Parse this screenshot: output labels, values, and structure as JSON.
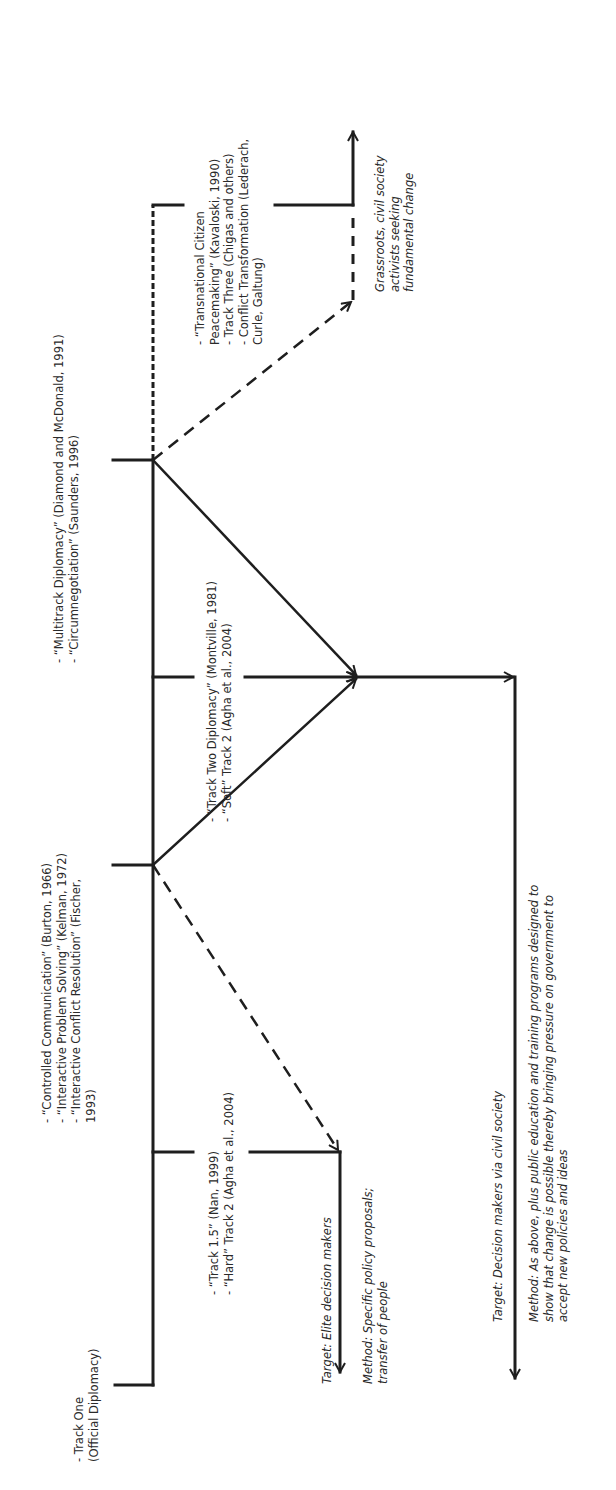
{
  "diagram": {
    "orientation": "rotated-90-ccw",
    "colors": {
      "line": "#1e1e1e",
      "text": "#2a2a2a",
      "background": "#ffffff"
    },
    "track_one": {
      "lines": [
        "- Track One",
        "(Official Diplomacy)"
      ]
    },
    "group_problem_solving": {
      "lines": [
        "- “Controlled Communication” (Burton, 1966)",
        "- “Interactive Problem Solving” (Kelman, 1972)",
        "- “Interactive Conflict Resolution” (Fischer,",
        "   1993)"
      ]
    },
    "group_multitrack": {
      "lines": [
        "- “Multitrack Diplomacy” (Diamond and McDonald, 1991)",
        "- “Circumnegotiation” (Saunders, 1996)"
      ]
    },
    "track_one_five": {
      "lines": [
        "- “Track 1.5” (Nan, 1999)",
        "- “Hard” Track 2 (Agha et al., 2004)"
      ]
    },
    "track_two": {
      "lines": [
        "- “Track Two Diplomacy” (Montville, 1981)",
        "- “Soft” Track 2 (Agha et al., 2004)"
      ]
    },
    "track_three": {
      "lines": [
        "- “Transnational Citizen",
        "   Peacemaking” (Kavaloski, 1990)",
        "- Track Three (Chigas and others)",
        "- Conflict Transformation (Lederach,",
        "   Curle, Galtung)"
      ]
    },
    "elite_outcome": {
      "target": "Target: Elite decision makers",
      "method_lines": [
        "Method: Specific policy proposals;",
        "transfer of people"
      ]
    },
    "civil_outcome": {
      "target": "Target: Decision makers via civil society",
      "method_lines": [
        "Method: As above, plus public education and training programs designed to",
        "show that change is possible thereby bringing pressure on government to",
        "accept new policies and ideas"
      ]
    },
    "grassroots_outcome": {
      "lines": [
        "Grassroots, civil society",
        "activists seeking",
        "fundamental change"
      ]
    }
  }
}
